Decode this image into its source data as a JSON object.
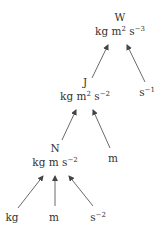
{
  "diagram": {
    "type": "unit-derivation-tree",
    "nodes": {
      "watt": {
        "symbol": "W",
        "units_base": "kg m",
        "units_exp1": "2",
        "units_s": " s",
        "units_exp2": "−3"
      },
      "inverse_second": {
        "base": "s",
        "exp": "−1"
      },
      "joule": {
        "symbol": "J",
        "units_base": "kg m",
        "units_exp1": "2",
        "units_s": " s",
        "units_exp2": "−2"
      },
      "metre_mid": {
        "label": "m"
      },
      "newton": {
        "symbol": "N",
        "units_base": "kg m s",
        "units_exp": "−2"
      },
      "kilogram": {
        "label": "kg"
      },
      "metre_bottom": {
        "label": "m"
      },
      "inverse_second_sq": {
        "base": "s",
        "exp": "−2"
      }
    },
    "edges": [
      {
        "from": "joule",
        "to": "watt"
      },
      {
        "from": "inverse_second",
        "to": "watt"
      },
      {
        "from": "newton",
        "to": "joule"
      },
      {
        "from": "metre_mid",
        "to": "joule"
      },
      {
        "from": "kilogram",
        "to": "newton"
      },
      {
        "from": "metre_bottom",
        "to": "newton"
      },
      {
        "from": "inverse_second_sq",
        "to": "newton"
      }
    ],
    "colors": {
      "text": "#333333",
      "arrow": "#444444",
      "background": "#ffffff"
    }
  }
}
